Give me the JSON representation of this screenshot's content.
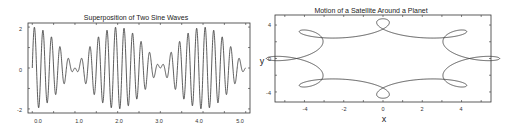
{
  "chart_data": [
    {
      "type": "line",
      "title": "Superposition of Two Sine Waves",
      "xlabel": "",
      "ylabel": "",
      "xlim": [
        -0.1,
        5.1
      ],
      "ylim": [
        -2.2,
        2.2
      ],
      "x_ticks": [
        "0.0",
        "1.0",
        "2.0",
        "3.0",
        "4.0",
        "5.0"
      ],
      "y_ticks": [
        "2",
        "0",
        "-2"
      ],
      "grid": false,
      "series": [
        {
          "name": "sin(2π·4.75t) + sin(2π·5.25t)",
          "f1": 4.75,
          "f2": 5.25,
          "x_start": 0,
          "x_end": 5
        }
      ]
    },
    {
      "type": "line",
      "title": "Motion of a Satellite Around a Planet",
      "xlabel": "x",
      "ylabel": "y",
      "xlim": [
        -5.5,
        5.5
      ],
      "ylim": [
        -5.2,
        5.2
      ],
      "x_ticks": [
        "-4",
        "-2",
        "0",
        "2",
        "4"
      ],
      "y_ticks": [
        "4",
        "0",
        "-4"
      ],
      "grid": false,
      "series": [
        {
          "name": "orbit",
          "R": 4.0,
          "r": 1.0,
          "loops": 6,
          "aspect_x": 1.25
        }
      ]
    }
  ],
  "left": {
    "title": "Superposition of Two Sine Waves",
    "xticks": [
      "0.0",
      "1.0",
      "2.0",
      "3.0",
      "4.0",
      "5.0"
    ],
    "yticks": [
      "2",
      "0",
      "-2"
    ]
  },
  "right": {
    "title": "Motion of a Satellite Around a Planet",
    "xlabel": "x",
    "ylabel": "y",
    "xticks": [
      "-4",
      "-2",
      "0",
      "2",
      "4"
    ],
    "yticks": [
      "4",
      "0",
      "-4"
    ]
  }
}
